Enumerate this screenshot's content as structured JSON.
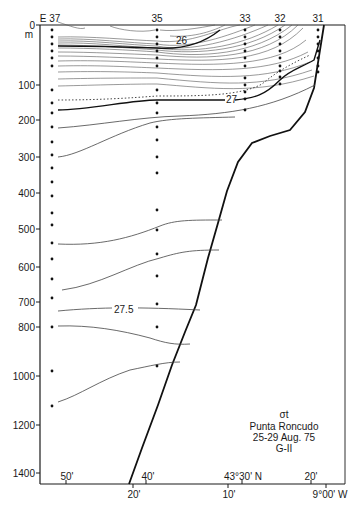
{
  "chart_data": {
    "type": "contour-section",
    "title": "σt",
    "subtitle_lines": [
      "Punta Roncudo",
      "25-29 Aug. 75",
      "G-II"
    ],
    "ylabel": "m",
    "yaxis": {
      "ticks": [
        0,
        100,
        200,
        300,
        400,
        500,
        600,
        700,
        800,
        1000,
        1200,
        1400
      ],
      "tick_labels": [
        "0",
        "100",
        "200",
        "300",
        "400",
        "500",
        "600",
        "700",
        "800",
        "1000",
        "1200",
        "1400"
      ],
      "range": [
        0,
        1450
      ]
    },
    "xaxis_top_labels": [
      {
        "label": "E 37",
        "x": 52
      },
      {
        "label": "35",
        "x": 157
      },
      {
        "label": "33",
        "x": 245
      },
      {
        "label": "32",
        "x": 280
      },
      {
        "label": "31",
        "x": 318
      }
    ],
    "xaxis_bottom_inner": [
      {
        "label": "50'",
        "x": 66
      },
      {
        "label": "40'",
        "x": 146
      },
      {
        "label": "43°30' N",
        "x": 242
      },
      {
        "label": "20'",
        "x": 311
      }
    ],
    "xaxis_bottom_outer": [
      {
        "label": "20'",
        "x": 133
      },
      {
        "label": "10'",
        "x": 228
      },
      {
        "label": "9°00' W",
        "x": 330
      }
    ],
    "contour_labels": [
      {
        "label": "26",
        "x": 180,
        "y": 41
      },
      {
        "label": "27",
        "x": 233,
        "y": 105
      },
      {
        "label": "27.5",
        "x": 150,
        "y": 302
      }
    ],
    "stations": [
      {
        "id": "37",
        "x": 52,
        "depths_px": [
          30,
          37,
          44,
          51,
          58,
          66,
          90,
          103,
          113,
          127,
          142,
          155,
          168,
          182,
          196,
          213,
          225,
          243,
          259,
          279,
          298,
          327,
          371,
          406
        ]
      },
      {
        "id": "35",
        "x": 157,
        "depths_px": [
          30,
          37,
          44,
          51,
          58,
          66,
          90,
          103,
          113,
          127,
          140,
          157,
          173,
          210,
          230,
          254,
          276,
          304,
          327,
          366
        ]
      },
      {
        "id": "33",
        "x": 245,
        "depths_px": [
          30,
          37,
          44,
          51,
          58,
          66,
          78,
          85,
          92,
          99,
          110
        ]
      },
      {
        "id": "32",
        "x": 280,
        "depths_px": [
          30,
          37,
          44,
          51,
          58,
          66,
          71,
          77,
          84
        ]
      },
      {
        "id": "31",
        "x": 318,
        "depths_px": [
          30,
          37,
          44,
          51,
          58,
          66,
          72
        ]
      }
    ],
    "grid": false,
    "legend": "none"
  }
}
